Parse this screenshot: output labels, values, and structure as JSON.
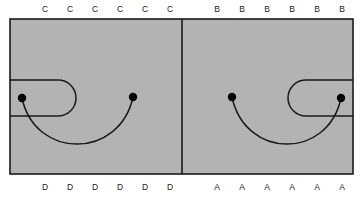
{
  "figure": {
    "background_color": "#ffffff",
    "panel_fill_color": "#b3b3b3",
    "line_color": "#1a1a1a",
    "label_color": "#1a1a1a",
    "dot_color": "#000000",
    "canvas": {
      "width": 363,
      "height": 198
    }
  },
  "frame": {
    "x": 10,
    "y": 19,
    "width": 343,
    "height": 155,
    "divider_x": 182,
    "stroke_width": 1.6
  },
  "panels": [
    {
      "id": "left-panel",
      "name": "left-panel",
      "x": 10,
      "y": 19,
      "width": 172,
      "height": 155,
      "top_labels": [
        "C",
        "C",
        "C",
        "C",
        "C",
        "C"
      ],
      "bottom_labels": [
        "D",
        "D",
        "D",
        "D",
        "D",
        "D"
      ],
      "top_label_start_x": 45,
      "top_label_end_x": 170,
      "top_label_y": 10,
      "bottom_label_start_x": 45,
      "bottom_label_end_x": 170,
      "bottom_label_y": 188,
      "dots": [
        {
          "name": "left-dot",
          "cx": 22,
          "cy": 98,
          "r": 4.2
        },
        {
          "name": "right-dot",
          "cx": 133,
          "cy": 97,
          "r": 4.2
        }
      ],
      "stadium": {
        "name": "stadium-open-left",
        "orientation": "open-left",
        "left_x": 10,
        "right_x": 76,
        "top_y": 80,
        "bottom_y": 116
      },
      "big_arc": {
        "name": "connecting-arc",
        "from_x": 22,
        "from_y": 98,
        "to_x": 133,
        "to_y": 97,
        "sag": 46
      }
    },
    {
      "id": "right-panel",
      "name": "right-panel",
      "x": 182,
      "y": 19,
      "width": 171,
      "height": 155,
      "top_labels": [
        "B",
        "B",
        "B",
        "B",
        "B",
        "B"
      ],
      "bottom_labels": [
        "A",
        "A",
        "A",
        "A",
        "A",
        "A"
      ],
      "top_label_start_x": 217,
      "top_label_end_x": 342,
      "top_label_y": 10,
      "bottom_label_start_x": 217,
      "bottom_label_end_x": 342,
      "bottom_label_y": 188,
      "dots": [
        {
          "name": "left-dot",
          "cx": 232,
          "cy": 97,
          "r": 4.2
        },
        {
          "name": "right-dot",
          "cx": 341,
          "cy": 98,
          "r": 4.2
        }
      ],
      "stadium": {
        "name": "stadium-open-right",
        "orientation": "open-right",
        "left_x": 288,
        "right_x": 353,
        "top_y": 80,
        "bottom_y": 116
      },
      "big_arc": {
        "name": "connecting-arc",
        "from_x": 232,
        "from_y": 97,
        "to_x": 341,
        "to_y": 98,
        "sag": 46
      }
    }
  ]
}
